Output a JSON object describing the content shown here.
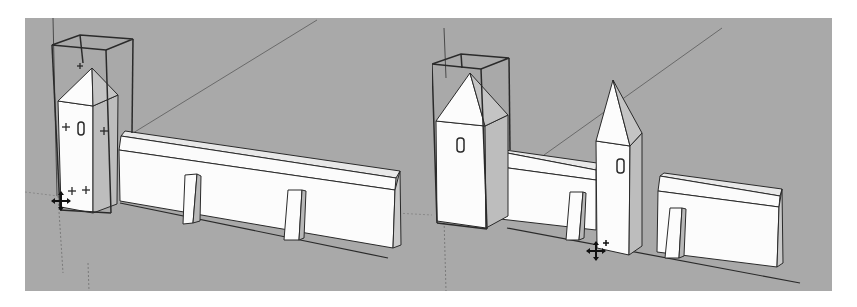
{
  "app": {
    "kind": "3d-modeling-viewport",
    "background_color": "#fefefe",
    "viewport_color": "#a9a9a9",
    "face_color": "#fcfcfc",
    "shade_color": "#c4c4c4",
    "edge_color": "#2a2a2a",
    "axis_color": "#5e5e5e"
  },
  "viewports": [
    {
      "id": "left",
      "description": "Before: tower component selected, wall with two buttresses",
      "selection": "tower-bounding-box",
      "cursor": "move-tool-cursor",
      "objects": [
        "tower-selected",
        "long-wall"
      ]
    },
    {
      "id": "right",
      "description": "After: tower copied and placed between two wall segments",
      "selection": "tower-bounding-box",
      "cursor": "move-copy-cursor",
      "objects": [
        "tower-selected",
        "wall-segment-left",
        "tower-copy",
        "wall-segment-right"
      ]
    }
  ]
}
